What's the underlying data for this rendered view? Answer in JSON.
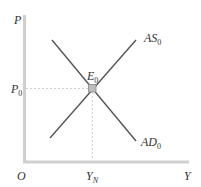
{
  "diagram": {
    "type": "AS-AD equilibrium",
    "axes": {
      "y_label": "P",
      "x_label": "Y",
      "origin_label": "O"
    },
    "curves": {
      "as": {
        "label": "AS",
        "subscript": "0"
      },
      "ad": {
        "label": "AD",
        "subscript": "0"
      }
    },
    "equilibrium": {
      "label": "E",
      "subscript": "0"
    },
    "price_level": {
      "label": "P",
      "subscript": "0"
    },
    "output_level": {
      "label": "Y",
      "subscript": "N"
    },
    "colors": {
      "axis": "#cfcfcf",
      "curve": "#555555",
      "guide": "#d0d0d0",
      "point_fill": "#bdbdbd",
      "point_stroke": "#888888",
      "text": "#333333"
    }
  }
}
